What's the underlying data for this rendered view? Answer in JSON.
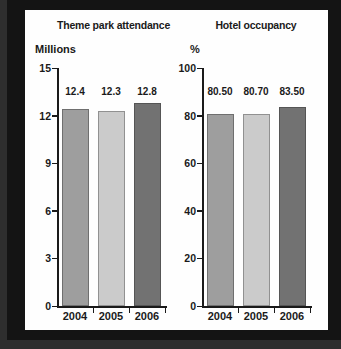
{
  "page": {
    "background": "#141414",
    "edge_color": "#2e2e2e",
    "panel_background": "#fefefe",
    "text_color": "#1a1a1a",
    "axis_color": "#1a1a1a"
  },
  "chart_data": [
    {
      "type": "bar",
      "title": "Theme park attendance",
      "ylabel": "Millions",
      "xlabel": "",
      "categories": [
        "2004",
        "2005",
        "2006"
      ],
      "values": [
        12.4,
        12.3,
        12.8
      ],
      "value_labels": [
        "12.4",
        "12.3",
        "12.8"
      ],
      "ylim": [
        0,
        15
      ],
      "yticks": [
        0,
        3,
        6,
        9,
        12,
        15
      ],
      "ytick_labels": [
        "0",
        "3",
        "6",
        "9",
        "12",
        "15"
      ],
      "grid": false,
      "legend": null,
      "bar_colors": [
        "#9e9e9e",
        "#cbcbcb",
        "#727272"
      ],
      "bar_border_colors": [
        "#6f6f6f",
        "#919191",
        "#555555"
      ]
    },
    {
      "type": "bar",
      "title": "Hotel occupancy",
      "ylabel": "%",
      "xlabel": "",
      "categories": [
        "2004",
        "2005",
        "2006"
      ],
      "values": [
        80.5,
        80.7,
        83.5
      ],
      "value_labels": [
        "80.50",
        "80.70",
        "83.50"
      ],
      "ylim": [
        0,
        100
      ],
      "yticks": [
        0,
        20,
        40,
        60,
        80,
        100
      ],
      "ytick_labels": [
        "0",
        "20",
        "40",
        "60",
        "80",
        "100"
      ],
      "grid": false,
      "legend": null,
      "bar_colors": [
        "#9e9e9e",
        "#cbcbcb",
        "#727272"
      ],
      "bar_border_colors": [
        "#6f6f6f",
        "#919191",
        "#555555"
      ]
    }
  ]
}
